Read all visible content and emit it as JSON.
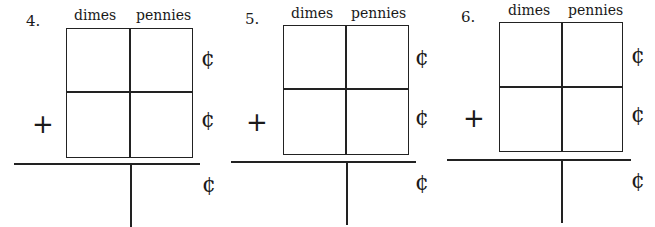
{
  "problems": [
    {
      "number": "4.",
      "col1": "dimes",
      "col2": "pennies",
      "operator": "+",
      "unit": "¢",
      "cells": {
        "top_dimes": "",
        "top_pennies": "",
        "bottom_dimes": "",
        "bottom_pennies": "",
        "answer_dimes": "",
        "answer_pennies": ""
      }
    },
    {
      "number": "5.",
      "col1": "dimes",
      "col2": "pennies",
      "operator": "+",
      "unit": "¢",
      "cells": {
        "top_dimes": "",
        "top_pennies": "",
        "bottom_dimes": "",
        "bottom_pennies": "",
        "answer_dimes": "",
        "answer_pennies": ""
      }
    },
    {
      "number": "6.",
      "col1": "dimes",
      "col2": "pennies",
      "operator": "+",
      "unit": "¢",
      "cells": {
        "top_dimes": "",
        "top_pennies": "",
        "bottom_dimes": "",
        "bottom_pennies": "",
        "answer_dimes": "",
        "answer_pennies": ""
      }
    }
  ]
}
